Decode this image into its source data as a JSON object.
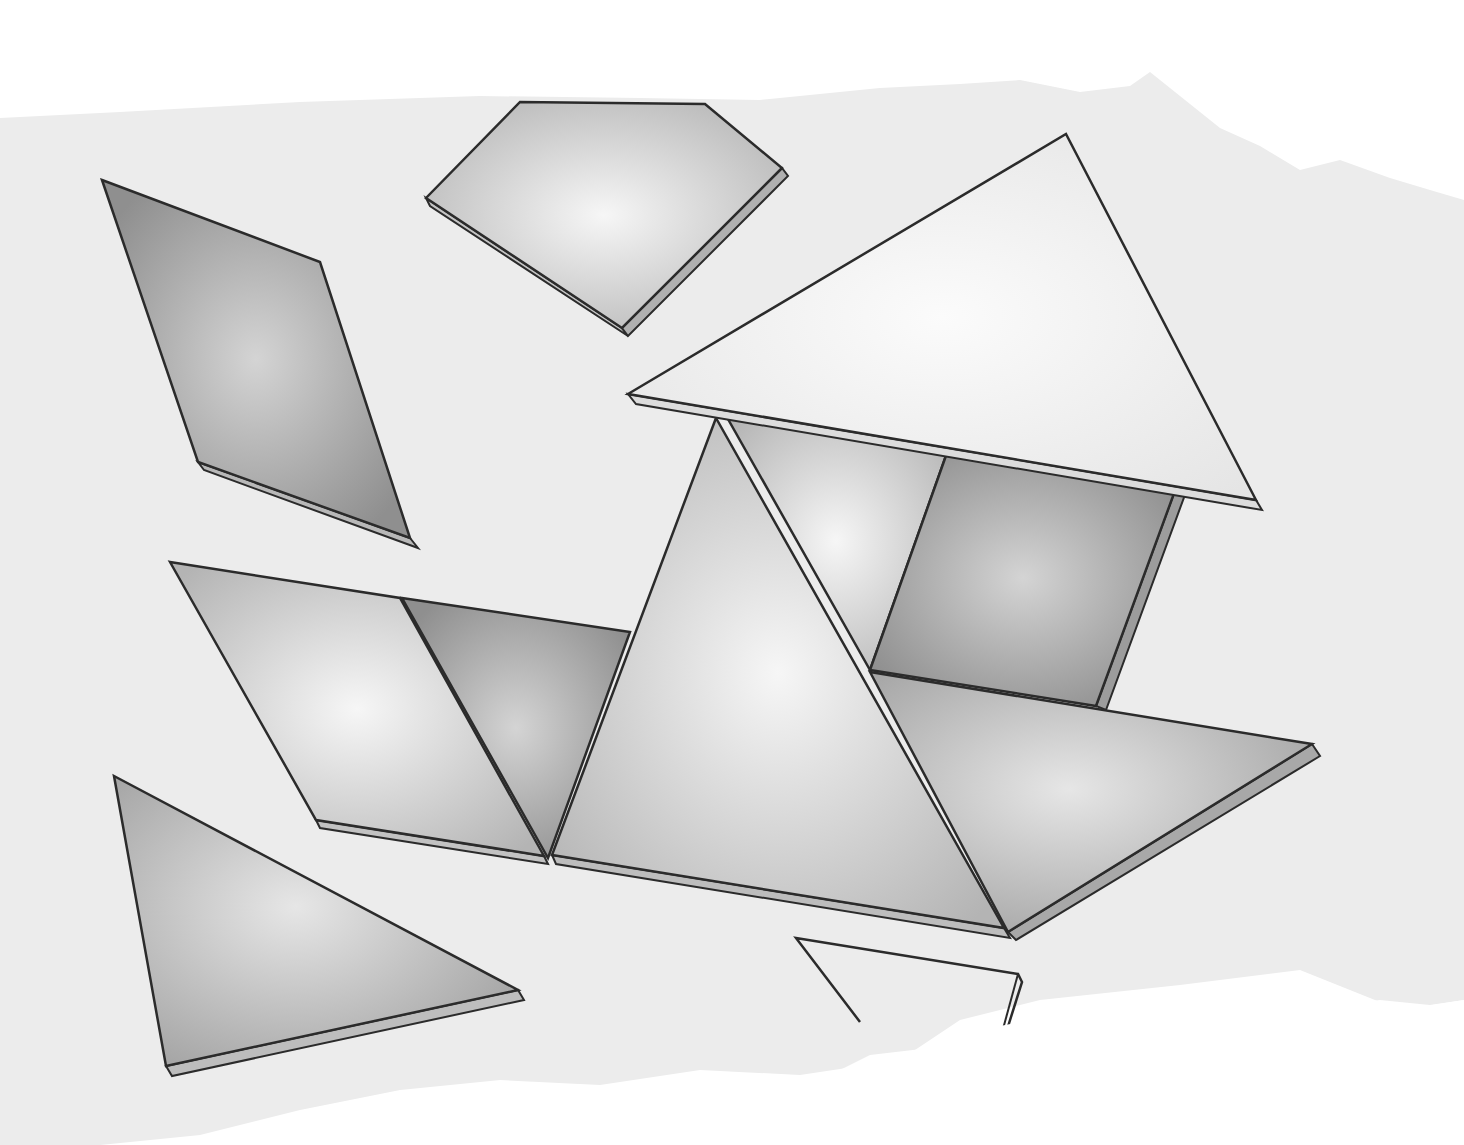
{
  "image": {
    "subject": "Tangram pieces (grey shaded tiles with thickness) on a torn-edge paper background",
    "background_color": "#ffffff",
    "paper_color": "#ececec",
    "outline_color": "#2b2b2b",
    "pieces": [
      {
        "id": "parallelogram-left",
        "kind": "parallelogram",
        "tone": "dark"
      },
      {
        "id": "square-top",
        "kind": "square",
        "tone": "light"
      },
      {
        "id": "large-triangle-roof",
        "kind": "large-triangle",
        "tone": "white"
      },
      {
        "id": "parallelogram-middle-left",
        "kind": "parallelogram",
        "tone": "light"
      },
      {
        "id": "small-triangle-middle",
        "kind": "small-triangle",
        "tone": "dark"
      },
      {
        "id": "large-triangle-center",
        "kind": "large-triangle",
        "tone": "light"
      },
      {
        "id": "small-triangle-upper",
        "kind": "small-triangle",
        "tone": "light"
      },
      {
        "id": "square-right",
        "kind": "square",
        "tone": "dark"
      },
      {
        "id": "large-triangle-right",
        "kind": "large-triangle",
        "tone": "medium"
      },
      {
        "id": "triangle-bottom-left",
        "kind": "medium-triangle",
        "tone": "medium"
      },
      {
        "id": "shape-bottom-outline",
        "kind": "outline-only",
        "tone": "white"
      }
    ]
  }
}
